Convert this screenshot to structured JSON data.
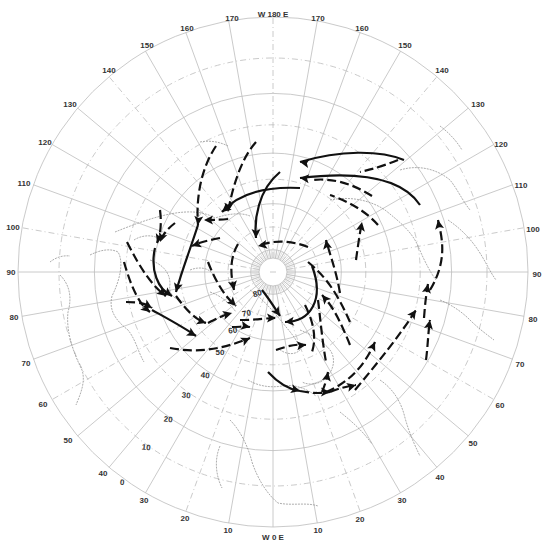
{
  "map": {
    "title": "",
    "projection": "north polar stereographic",
    "center": {
      "x": 273,
      "y": 272
    },
    "outer_radius": 255,
    "colors": {
      "grid": "#bdbdbd",
      "coast": "#8a8a8a",
      "tracks": "#111111",
      "labels": "#333333"
    },
    "meridian_labels": [
      {
        "text": "W 180 E",
        "x": 273,
        "y": 17
      },
      {
        "text": "170",
        "x": 232,
        "y": 21
      },
      {
        "text": "160",
        "x": 187,
        "y": 31
      },
      {
        "text": "150",
        "x": 147,
        "y": 48
      },
      {
        "text": "140",
        "x": 109,
        "y": 73
      },
      {
        "text": "130",
        "x": 70,
        "y": 107
      },
      {
        "text": "120",
        "x": 45,
        "y": 145
      },
      {
        "text": "110",
        "x": 24,
        "y": 186
      },
      {
        "text": "100",
        "x": 13,
        "y": 230
      },
      {
        "text": "90",
        "x": 11,
        "y": 275
      },
      {
        "text": "80",
        "x": 14,
        "y": 320
      },
      {
        "text": "70",
        "x": 26,
        "y": 366
      },
      {
        "text": "60",
        "x": 43,
        "y": 407
      },
      {
        "text": "50",
        "x": 68,
        "y": 443
      },
      {
        "text": "40",
        "x": 103,
        "y": 476
      },
      {
        "text": "30",
        "x": 144,
        "y": 503
      },
      {
        "text": "20",
        "x": 185,
        "y": 521
      },
      {
        "text": "10",
        "x": 228,
        "y": 533
      },
      {
        "text": "W 0 E",
        "x": 273,
        "y": 540
      },
      {
        "text": "10",
        "x": 318,
        "y": 533
      },
      {
        "text": "20",
        "x": 360,
        "y": 522
      },
      {
        "text": "30",
        "x": 402,
        "y": 503
      },
      {
        "text": "40",
        "x": 440,
        "y": 480
      },
      {
        "text": "50",
        "x": 473,
        "y": 446
      },
      {
        "text": "60",
        "x": 500,
        "y": 408
      },
      {
        "text": "70",
        "x": 520,
        "y": 367
      },
      {
        "text": "80",
        "x": 533,
        "y": 322
      },
      {
        "text": "90",
        "x": 537,
        "y": 277
      },
      {
        "text": "100",
        "x": 533,
        "y": 232
      },
      {
        "text": "110",
        "x": 521,
        "y": 188
      },
      {
        "text": "120",
        "x": 501,
        "y": 147
      },
      {
        "text": "130",
        "x": 478,
        "y": 107
      },
      {
        "text": "140",
        "x": 442,
        "y": 73
      },
      {
        "text": "150",
        "x": 405,
        "y": 48
      },
      {
        "text": "160",
        "x": 362,
        "y": 31
      },
      {
        "text": "170",
        "x": 318,
        "y": 21
      }
    ],
    "latitude_labels": [
      {
        "text": "80",
        "x": 258,
        "y": 296,
        "rot": -55
      },
      {
        "text": "70",
        "x": 247,
        "y": 316,
        "rot": -50
      },
      {
        "text": "60",
        "x": 233,
        "y": 333,
        "rot": -45
      },
      {
        "text": "50",
        "x": 220,
        "y": 355,
        "rot": -40
      },
      {
        "text": "40",
        "x": 205,
        "y": 378,
        "rot": -35
      },
      {
        "text": "30",
        "x": 186,
        "y": 398,
        "rot": -35
      },
      {
        "text": "20",
        "x": 168,
        "y": 422,
        "rot": -35
      },
      {
        "text": "10",
        "x": 146,
        "y": 450,
        "rot": -35
      },
      {
        "text": "0",
        "x": 122,
        "y": 485,
        "rot": -35
      }
    ],
    "latitude_circles_deg": [
      80,
      70,
      60,
      50,
      40,
      30,
      20,
      10,
      0
    ],
    "meridian_step_deg": 10,
    "legend": null
  },
  "tracks": [
    {
      "id": "t1",
      "style": "dash",
      "d": "M 216 146 C 200 170 196 200 198 225",
      "arrow": {
        "x": 198,
        "y": 225,
        "angle": 95
      }
    },
    {
      "id": "t2",
      "style": "dash",
      "d": "M 256 142 C 240 160 232 190 228 212",
      "arrow": {
        "x": 228,
        "y": 212,
        "angle": 95
      }
    },
    {
      "id": "t3",
      "style": "solid",
      "d": "M 300 188 C 260 186 236 196 222 212",
      "arrow": {
        "x": 222,
        "y": 212,
        "angle": 140
      }
    },
    {
      "id": "t4",
      "style": "dash",
      "d": "M 228 219 C 218 220 210 220 204 220",
      "arrow": {
        "x": 204,
        "y": 220,
        "angle": 180
      }
    },
    {
      "id": "t5",
      "style": "dash",
      "d": "M 160 210 C 162 225 160 236 157 243",
      "arrow": {
        "x": 157,
        "y": 243,
        "angle": 110
      }
    },
    {
      "id": "t6",
      "style": "dash",
      "d": "M 175 223 C 166 230 162 236 160 242",
      "arrow": {
        "x": 160,
        "y": 242,
        "angle": 110
      }
    },
    {
      "id": "t7",
      "style": "solid",
      "d": "M 198 225 C 190 250 182 270 176 292",
      "arrow": {
        "x": 176,
        "y": 292,
        "angle": 105
      }
    },
    {
      "id": "t8",
      "style": "dash",
      "d": "M 220 238 C 210 240 200 242 192 246",
      "arrow": {
        "x": 192,
        "y": 246,
        "angle": 160
      }
    },
    {
      "id": "t9",
      "style": "solid",
      "d": "M 155 248 C 150 270 158 290 172 296",
      "arrow": {
        "x": 172,
        "y": 296,
        "angle": 35
      }
    },
    {
      "id": "t10",
      "style": "dash",
      "d": "M 127 242 C 140 268 152 286 166 296",
      "arrow": {
        "x": 166,
        "y": 296,
        "angle": 40
      }
    },
    {
      "id": "t11",
      "style": "dash",
      "d": "M 124 262 C 132 290 140 305 150 312",
      "arrow": {
        "x": 150,
        "y": 312,
        "angle": 40
      }
    },
    {
      "id": "t12",
      "style": "dash",
      "d": "M 126 302 C 140 302 148 304 152 308",
      "arrow": {
        "x": 152,
        "y": 308,
        "angle": 30
      }
    },
    {
      "id": "t13",
      "style": "dash",
      "d": "M 176 296 C 186 310 196 320 206 323",
      "arrow": {
        "x": 206,
        "y": 323,
        "angle": 20
      }
    },
    {
      "id": "t14",
      "style": "solid",
      "d": "M 152 310 C 170 320 185 328 196 336",
      "arrow": {
        "x": 196,
        "y": 336,
        "angle": 30
      }
    },
    {
      "id": "t15",
      "style": "dash",
      "d": "M 170 348 C 200 354 225 348 250 338",
      "arrow": {
        "x": 250,
        "y": 338,
        "angle": -25
      }
    },
    {
      "id": "t16",
      "style": "dash",
      "d": "M 208 323 C 218 318 226 314 232 313",
      "arrow": {
        "x": 232,
        "y": 313,
        "angle": -15
      }
    },
    {
      "id": "t17",
      "style": "dash",
      "d": "M 240 320 C 256 320 266 318 276 318",
      "arrow": {
        "x": 276,
        "y": 318,
        "angle": 0
      }
    },
    {
      "id": "t18",
      "style": "dash",
      "d": "M 232 327 C 240 327 246 326 250 327",
      "arrow": {
        "x": 250,
        "y": 327,
        "angle": 10
      }
    },
    {
      "id": "t19",
      "style": "dash",
      "d": "M 208 262 C 215 280 224 296 236 306",
      "arrow": {
        "x": 236,
        "y": 306,
        "angle": 45
      }
    },
    {
      "id": "t20",
      "style": "dash",
      "d": "M 238 244 C 230 258 230 272 234 290",
      "arrow": {
        "x": 234,
        "y": 290,
        "angle": 80
      }
    },
    {
      "id": "t21",
      "style": "solid",
      "d": "M 262 290 C 270 300 276 310 280 316",
      "arrow": {
        "x": 280,
        "y": 316,
        "angle": 55
      }
    },
    {
      "id": "t22",
      "style": "solid",
      "d": "M 280 172 C 258 190 254 220 256 238",
      "arrow": {
        "x": 256,
        "y": 238,
        "angle": 90
      }
    },
    {
      "id": "t23",
      "style": "dash",
      "d": "M 308 247 C 290 240 272 240 258 246",
      "arrow": {
        "x": 258,
        "y": 246,
        "angle": 170
      }
    },
    {
      "id": "t24",
      "style": "solid",
      "d": "M 312 266 C 325 300 310 322 285 322",
      "arrow": {
        "x": 285,
        "y": 322,
        "angle": 175
      }
    },
    {
      "id": "t25",
      "style": "dash",
      "d": "M 308 262 C 330 280 340 300 350 322",
      "arrow": null
    },
    {
      "id": "t26",
      "style": "solid",
      "d": "M 404 160 C 380 150 340 150 300 162",
      "arrow": {
        "x": 300,
        "y": 162,
        "angle": 190
      }
    },
    {
      "id": "t27",
      "style": "dash",
      "d": "M 398 160 C 378 168 368 170 360 172",
      "arrow": null
    },
    {
      "id": "t28",
      "style": "solid",
      "d": "M 420 205 C 400 175 350 172 300 178",
      "arrow": {
        "x": 300,
        "y": 178,
        "angle": 185
      }
    },
    {
      "id": "t29",
      "style": "dash",
      "d": "M 372 196 C 350 182 330 178 312 180",
      "arrow": null
    },
    {
      "id": "t30",
      "style": "dash",
      "d": "M 378 225 C 365 210 345 200 330 195",
      "arrow": null
    },
    {
      "id": "t31",
      "style": "dash",
      "d": "M 356 260 C 358 245 360 232 362 222",
      "arrow": {
        "x": 362,
        "y": 222,
        "angle": -80
      }
    },
    {
      "id": "t32",
      "style": "dash",
      "d": "M 340 293 C 336 270 330 255 326 240",
      "arrow": {
        "x": 326,
        "y": 240,
        "angle": -100
      }
    },
    {
      "id": "t33",
      "style": "dash",
      "d": "M 350 345 C 340 320 332 305 322 295",
      "arrow": {
        "x": 322,
        "y": 295,
        "angle": -130
      }
    },
    {
      "id": "t34",
      "style": "dash",
      "d": "M 430 290 C 448 260 442 238 438 220",
      "arrow": {
        "x": 438,
        "y": 220,
        "angle": -100
      }
    },
    {
      "id": "t35",
      "style": "dash",
      "d": "M 424 318 C 425 305 426 295 428 284",
      "arrow": {
        "x": 428,
        "y": 284,
        "angle": -80
      }
    },
    {
      "id": "t36",
      "style": "dash",
      "d": "M 426 360 C 428 345 428 333 430 320",
      "arrow": {
        "x": 430,
        "y": 320,
        "angle": -80
      }
    },
    {
      "id": "t37",
      "style": "dash",
      "d": "M 355 390 C 380 360 400 335 416 310",
      "arrow": {
        "x": 416,
        "y": 310,
        "angle": -55
      }
    },
    {
      "id": "t38",
      "style": "dash",
      "d": "M 326 392 C 350 382 365 365 375 342",
      "arrow": {
        "x": 375,
        "y": 342,
        "angle": -65
      }
    },
    {
      "id": "t39",
      "style": "dash",
      "d": "M 318 300 C 320 315 322 340 326 362",
      "arrow": null
    },
    {
      "id": "t40",
      "style": "dash",
      "d": "M 276 350 C 290 345 298 344 306 345",
      "arrow": {
        "x": 306,
        "y": 345,
        "angle": -5
      }
    },
    {
      "id": "t41",
      "style": "dash",
      "d": "M 305 305 C 315 325 316 340 312 352",
      "arrow": null
    },
    {
      "id": "t42",
      "style": "solid",
      "d": "M 268 372 C 280 385 292 390 300 391",
      "arrow": {
        "x": 300,
        "y": 391,
        "angle": 15
      }
    },
    {
      "id": "t43",
      "style": "dash",
      "d": "M 300 391 C 315 394 322 393 330 392",
      "arrow": {
        "x": 330,
        "y": 392,
        "angle": 0
      }
    },
    {
      "id": "t44",
      "style": "dash",
      "d": "M 322 392 C 325 385 327 378 328 372",
      "arrow": {
        "x": 328,
        "y": 372,
        "angle": -80
      }
    },
    {
      "id": "t45",
      "style": "dash",
      "d": "M 330 392 C 340 388 348 386 356 385",
      "arrow": {
        "x": 356,
        "y": 385,
        "angle": -15
      }
    }
  ],
  "coastlines_note": "Faint dotted continental outlines (North America, Greenland, Europe, Asia, Africa)"
}
